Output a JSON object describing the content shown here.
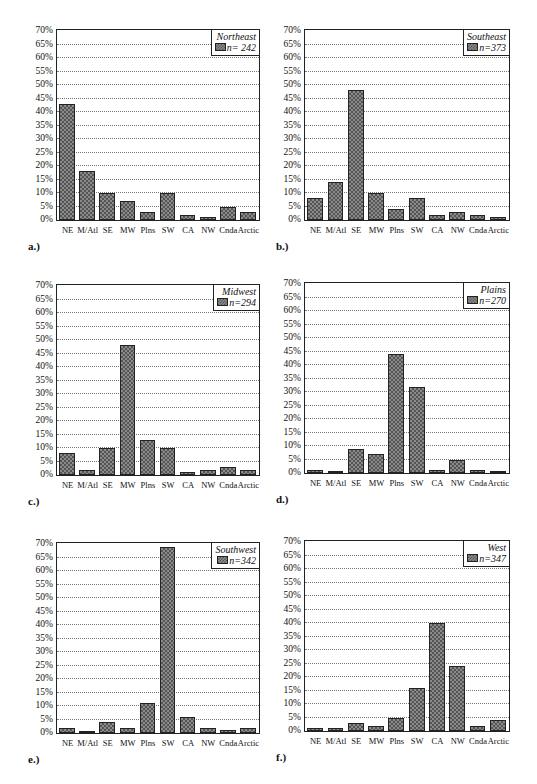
{
  "figure": {
    "caption_fragment": ""
  },
  "chart_data": [
    {
      "type": "bar",
      "panel": "a.)",
      "title": "Northeast",
      "legend": "n= 242",
      "categories": [
        "NE",
        "M/Atl",
        "SE",
        "MW",
        "Plns",
        "SW",
        "CA",
        "NW",
        "Cnda",
        "Arctic"
      ],
      "values": [
        43,
        18,
        10,
        7,
        3,
        10,
        2,
        1,
        5,
        3
      ],
      "ylim": [
        0,
        70
      ],
      "yticks": [
        "0%",
        "5%",
        "10%",
        "15%",
        "20%",
        "25%",
        "30%",
        "35%",
        "40%",
        "45%",
        "50%",
        "55%",
        "60%",
        "65%",
        "70%"
      ],
      "xlabel": "",
      "ylabel": "",
      "grid": true,
      "legend_position": "top-right"
    },
    {
      "type": "bar",
      "panel": "b.)",
      "title": "Southeast",
      "legend": "n=373",
      "categories": [
        "NE",
        "M/Atl",
        "SE",
        "MW",
        "Plns",
        "SW",
        "CA",
        "NW",
        "Cnda",
        "Arctic"
      ],
      "values": [
        8,
        14,
        48,
        10,
        4,
        8,
        2,
        3,
        2,
        1
      ],
      "ylim": [
        0,
        70
      ],
      "yticks": [
        "0%",
        "5%",
        "10%",
        "15%",
        "20%",
        "25%",
        "30%",
        "35%",
        "40%",
        "45%",
        "50%",
        "55%",
        "60%",
        "65%",
        "70%"
      ],
      "xlabel": "",
      "ylabel": "",
      "grid": true,
      "legend_position": "top-right"
    },
    {
      "type": "bar",
      "panel": "c.)",
      "title": "Midwest",
      "legend": "n=294",
      "categories": [
        "NE",
        "M/Atl",
        "SE",
        "MW",
        "Plns",
        "SW",
        "CA",
        "NW",
        "Cnda",
        "Arctic"
      ],
      "values": [
        8,
        2,
        10,
        48,
        13,
        10,
        1,
        2,
        3,
        2
      ],
      "ylim": [
        0,
        70
      ],
      "yticks": [
        "0%",
        "5%",
        "10%",
        "15%",
        "20%",
        "25%",
        "30%",
        "35%",
        "40%",
        "45%",
        "50%",
        "55%",
        "60%",
        "65%",
        "70%"
      ],
      "xlabel": "",
      "ylabel": "",
      "grid": true,
      "legend_position": "top-right"
    },
    {
      "type": "bar",
      "panel": "d.)",
      "title": "Plains",
      "legend": "n=270",
      "categories": [
        "NE",
        "M/Atl",
        "SE",
        "MW",
        "Plns",
        "SW",
        "CA",
        "NW",
        "Cnda",
        "Arctic"
      ],
      "values": [
        1,
        0.5,
        9,
        7,
        44,
        32,
        1,
        5,
        1,
        0.5
      ],
      "ylim": [
        0,
        70
      ],
      "yticks": [
        "0%",
        "5%",
        "10%",
        "15%",
        "20%",
        "25%",
        "30%",
        "35%",
        "40%",
        "45%",
        "50%",
        "55%",
        "60%",
        "65%",
        "70%"
      ],
      "xlabel": "",
      "ylabel": "",
      "grid": true,
      "legend_position": "top-right"
    },
    {
      "type": "bar",
      "panel": "e.)",
      "title": "Southwest",
      "legend": "n=342",
      "categories": [
        "NE",
        "M/Atl",
        "SE",
        "MW",
        "Plns",
        "SW",
        "CA",
        "NW",
        "Cnda",
        "Arctic"
      ],
      "values": [
        2,
        0.3,
        4,
        2,
        11,
        69,
        6,
        2,
        1,
        2
      ],
      "ylim": [
        0,
        70
      ],
      "yticks": [
        "0%",
        "5%",
        "10%",
        "15%",
        "20%",
        "25%",
        "30%",
        "35%",
        "40%",
        "45%",
        "50%",
        "55%",
        "60%",
        "65%",
        "70%"
      ],
      "xlabel": "",
      "ylabel": "",
      "grid": true,
      "legend_position": "top-right"
    },
    {
      "type": "bar",
      "panel": "f.)",
      "title": "West",
      "legend": "n=347",
      "categories": [
        "NE",
        "M/Atl",
        "SE",
        "MW",
        "Plns",
        "SW",
        "CA",
        "NW",
        "Cnda",
        "Arctic"
      ],
      "values": [
        1,
        1,
        3,
        2,
        5,
        16,
        40,
        24,
        2,
        4
      ],
      "ylim": [
        0,
        70
      ],
      "yticks": [
        "0%",
        "5%",
        "10%",
        "15%",
        "20%",
        "25%",
        "30%",
        "35%",
        "40%",
        "45%",
        "50%",
        "55%",
        "60%",
        "65%",
        "70%"
      ],
      "xlabel": "",
      "ylabel": "",
      "grid": true,
      "legend_position": "top-right"
    }
  ],
  "layout": {
    "panels": [
      {
        "left": 56,
        "top": 29,
        "width": 204,
        "height": 192,
        "label_x": 28,
        "label_y": 240
      },
      {
        "left": 304,
        "top": 29,
        "width": 206,
        "height": 192,
        "label_x": 276,
        "label_y": 240
      },
      {
        "left": 56,
        "top": 284,
        "width": 204,
        "height": 192,
        "label_x": 28,
        "label_y": 495
      },
      {
        "left": 304,
        "top": 282,
        "width": 206,
        "height": 192,
        "label_x": 276,
        "label_y": 493
      },
      {
        "left": 56,
        "top": 542,
        "width": 204,
        "height": 192,
        "label_x": 28,
        "label_y": 753
      },
      {
        "left": 304,
        "top": 540,
        "width": 206,
        "height": 192,
        "label_x": 276,
        "label_y": 751
      }
    ],
    "bar_color": "#8a8a8a"
  }
}
